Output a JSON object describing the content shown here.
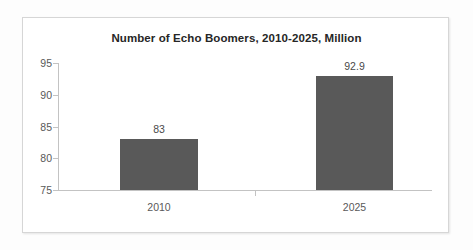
{
  "chart_data": {
    "type": "bar",
    "title": "Number of Echo Boomers, 2010-2025, Million",
    "xlabel": "",
    "ylabel": "",
    "categories": [
      "2010",
      "2025"
    ],
    "values": [
      83,
      92.9
    ],
    "data_labels": [
      "83",
      "92.9"
    ],
    "ylim": [
      75,
      95
    ],
    "yticks": [
      75,
      80,
      85,
      90,
      95
    ],
    "ytick_labels": [
      "75",
      "80",
      "85",
      "90",
      "95"
    ],
    "grid": false,
    "legend": false,
    "legend_position": "none",
    "series": [
      {
        "name": "Echo Boomers",
        "values": [
          83,
          92.9
        ],
        "color": "#595959"
      }
    ],
    "colors": {
      "bar": "#595959",
      "title_text": "#262626",
      "axis_text": "#595959",
      "data_label_text": "#4a4a4a",
      "axis_line": "#c3c3c3",
      "frame_border": "#d6d6d6",
      "plot_background": "#ffffff",
      "canvas_background": "#fdfdfd"
    }
  }
}
